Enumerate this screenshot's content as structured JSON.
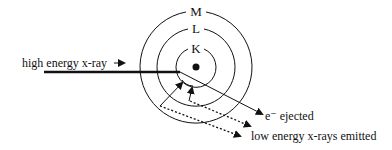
{
  "diagram": {
    "shells": [
      {
        "label": "K",
        "radius": 20
      },
      {
        "label": "L",
        "radius": 39
      },
      {
        "label": "M",
        "radius": 56
      }
    ],
    "labels": {
      "incident": "high energy x-ray",
      "ejected": "e⁻ ejected",
      "emitted": "low energy x-rays emitted"
    },
    "colors": {
      "stroke": "#111111",
      "background": "#ffffff"
    }
  }
}
